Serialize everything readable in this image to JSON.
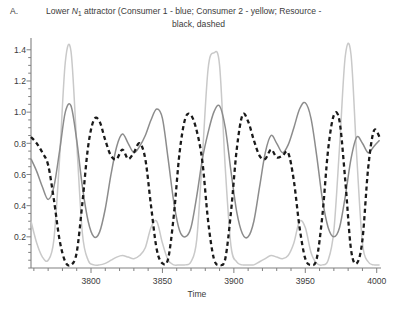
{
  "panel": {
    "label": "A."
  },
  "title": {
    "line1_pre": "Lower ",
    "line1_var": "N",
    "line1_sub": "1",
    "line1_post": " attractor (Consumer 1 - blue; Consumer 2 - yellow; Resource -",
    "line2": "black, dashed"
  },
  "colors": {
    "consumer1": "#8c8c8c",
    "consumer2": "#c9c9c9",
    "resource": "#1a1a1a",
    "axis": "#808080",
    "text": "#3b3b3b",
    "background": "#ffffff"
  },
  "chart_data": {
    "type": "line",
    "title": "Lower N1 attractor (Consumer 1 - blue; Consumer 2 - yellow; Resource - black, dashed",
    "xlabel": "Time",
    "ylabel": "",
    "xlim": [
      3758,
      4003
    ],
    "ylim": [
      0,
      1.45
    ],
    "grid": false,
    "legend_position": "none",
    "legend_entries": [
      {
        "name": "Consumer 1",
        "described_color": "blue",
        "rendered_color": "#8c8c8c",
        "style": "solid"
      },
      {
        "name": "Consumer 2",
        "described_color": "yellow",
        "rendered_color": "#c9c9c9",
        "style": "solid"
      },
      {
        "name": "Resource",
        "described_color": "black",
        "rendered_color": "#1a1a1a",
        "style": "dashed"
      }
    ],
    "xticks_major": [
      3800,
      3850,
      3900,
      3950,
      4000
    ],
    "xticks_minor_step": 10,
    "yticks_major": [
      0.2,
      0.4,
      0.6,
      0.8,
      1.0,
      1.2,
      1.4
    ],
    "yticks_minor_step": 0.05,
    "series": [
      {
        "name": "Consumer 1",
        "described_color": "blue",
        "rendered_color": "#8c8c8c",
        "style": "solid",
        "x": [
          3758,
          3762,
          3766,
          3770,
          3774,
          3778,
          3782,
          3786,
          3790,
          3794,
          3798,
          3802,
          3806,
          3810,
          3814,
          3818,
          3822,
          3826,
          3830,
          3834,
          3838,
          3842,
          3846,
          3850,
          3854,
          3858,
          3862,
          3866,
          3870,
          3874,
          3878,
          3882,
          3886,
          3890,
          3894,
          3898,
          3902,
          3906,
          3910,
          3914,
          3918,
          3922,
          3926,
          3930,
          3934,
          3938,
          3942,
          3946,
          3950,
          3954,
          3958,
          3962,
          3966,
          3970,
          3974,
          3978,
          3982,
          3986,
          3990,
          3994,
          3998,
          4002
        ],
        "y": [
          0.7,
          0.62,
          0.52,
          0.44,
          0.52,
          0.75,
          1.0,
          1.04,
          0.82,
          0.52,
          0.3,
          0.2,
          0.23,
          0.38,
          0.6,
          0.78,
          0.86,
          0.8,
          0.74,
          0.78,
          0.85,
          0.95,
          1.02,
          0.96,
          0.7,
          0.42,
          0.24,
          0.2,
          0.26,
          0.46,
          0.7,
          0.87,
          1.0,
          1.04,
          0.9,
          0.62,
          0.36,
          0.22,
          0.2,
          0.3,
          0.52,
          0.74,
          0.85,
          0.8,
          0.74,
          0.79,
          0.9,
          1.02,
          1.06,
          0.96,
          0.72,
          0.44,
          0.26,
          0.2,
          0.26,
          0.46,
          0.7,
          0.84,
          0.8,
          0.74,
          0.78,
          0.82
        ]
      },
      {
        "name": "Consumer 2",
        "described_color": "yellow",
        "rendered_color": "#c9c9c9",
        "style": "solid",
        "x": [
          3758,
          3762,
          3766,
          3770,
          3774,
          3778,
          3782,
          3786,
          3790,
          3794,
          3798,
          3802,
          3806,
          3810,
          3814,
          3818,
          3822,
          3826,
          3830,
          3834,
          3838,
          3842,
          3846,
          3850,
          3854,
          3858,
          3862,
          3866,
          3870,
          3874,
          3878,
          3882,
          3886,
          3890,
          3894,
          3898,
          3902,
          3906,
          3910,
          3914,
          3918,
          3922,
          3926,
          3930,
          3934,
          3938,
          3942,
          3946,
          3950,
          3954,
          3958,
          3962,
          3966,
          3970,
          3974,
          3978,
          3982,
          3986,
          3990,
          3994,
          3998,
          4002
        ],
        "y": [
          0.3,
          0.16,
          0.07,
          0.05,
          0.18,
          0.7,
          1.32,
          1.39,
          0.8,
          0.22,
          0.05,
          0.02,
          0.02,
          0.03,
          0.05,
          0.07,
          0.08,
          0.07,
          0.06,
          0.08,
          0.13,
          0.26,
          0.3,
          0.16,
          0.05,
          0.02,
          0.02,
          0.02,
          0.04,
          0.18,
          0.72,
          1.28,
          1.38,
          1.3,
          0.64,
          0.14,
          0.04,
          0.02,
          0.02,
          0.02,
          0.04,
          0.06,
          0.08,
          0.07,
          0.06,
          0.08,
          0.16,
          0.3,
          0.26,
          0.1,
          0.03,
          0.02,
          0.05,
          0.24,
          0.78,
          1.36,
          1.37,
          0.72,
          0.16,
          0.04,
          0.02,
          0.02
        ]
      },
      {
        "name": "Resource",
        "described_color": "black",
        "rendered_color": "#1a1a1a",
        "style": "dashed",
        "x": [
          3758,
          3762,
          3766,
          3770,
          3774,
          3778,
          3782,
          3786,
          3790,
          3794,
          3798,
          3802,
          3806,
          3810,
          3814,
          3818,
          3822,
          3826,
          3830,
          3834,
          3838,
          3842,
          3846,
          3850,
          3854,
          3858,
          3862,
          3866,
          3870,
          3874,
          3878,
          3882,
          3886,
          3890,
          3894,
          3898,
          3902,
          3906,
          3910,
          3914,
          3918,
          3922,
          3926,
          3930,
          3934,
          3938,
          3942,
          3946,
          3950,
          3954,
          3958,
          3962,
          3966,
          3970,
          3974,
          3978,
          3982,
          3986,
          3990,
          3994,
          3998,
          4002
        ],
        "y": [
          0.84,
          0.8,
          0.74,
          0.66,
          0.44,
          0.18,
          0.04,
          0.02,
          0.1,
          0.42,
          0.78,
          0.95,
          0.94,
          0.82,
          0.72,
          0.7,
          0.76,
          0.7,
          0.74,
          0.8,
          0.7,
          0.4,
          0.12,
          0.03,
          0.06,
          0.34,
          0.74,
          0.96,
          0.98,
          0.88,
          0.68,
          0.3,
          0.06,
          0.02,
          0.06,
          0.36,
          0.76,
          0.98,
          0.94,
          0.82,
          0.72,
          0.7,
          0.76,
          0.71,
          0.72,
          0.74,
          0.56,
          0.26,
          0.06,
          0.02,
          0.06,
          0.34,
          0.76,
          0.98,
          0.94,
          0.56,
          0.12,
          0.03,
          0.18,
          0.64,
          0.88,
          0.84
        ]
      }
    ]
  },
  "axis": {
    "xlabel": "Time",
    "ytick_labels": [
      "1.4",
      "1.2",
      "1.0",
      "0.8",
      "0.6",
      "0.4",
      "0.2"
    ],
    "xtick_labels": [
      "3800",
      "3850",
      "3900",
      "3950",
      "4000"
    ]
  }
}
